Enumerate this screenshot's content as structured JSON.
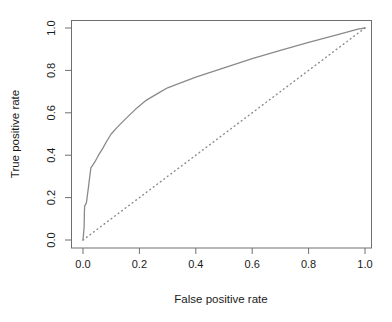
{
  "chart_data": {
    "type": "line",
    "title": "",
    "xlabel": "False positive rate",
    "ylabel": "True positive rate",
    "xlim": [
      0.0,
      1.0
    ],
    "ylim": [
      0.0,
      1.0
    ],
    "grid": false,
    "legend": "none",
    "x_ticks": [
      0.0,
      0.2,
      0.4,
      0.6,
      0.8,
      1.0
    ],
    "y_ticks": [
      0.0,
      0.2,
      0.4,
      0.6,
      0.8,
      1.0
    ],
    "x_tick_labels": [
      "0.0",
      "0.2",
      "0.4",
      "0.6",
      "0.8",
      "1.0"
    ],
    "y_tick_labels": [
      "0.0",
      "0.2",
      "0.4",
      "0.6",
      "0.8",
      "1.0"
    ],
    "series": [
      {
        "name": "ROC curve",
        "style": "solid",
        "color": "#8a8a8a",
        "points": [
          [
            0.0,
            0.0
          ],
          [
            0.004,
            0.06
          ],
          [
            0.005,
            0.135
          ],
          [
            0.006,
            0.16
          ],
          [
            0.012,
            0.175
          ],
          [
            0.016,
            0.215
          ],
          [
            0.02,
            0.255
          ],
          [
            0.024,
            0.3
          ],
          [
            0.028,
            0.34
          ],
          [
            0.034,
            0.352
          ],
          [
            0.042,
            0.368
          ],
          [
            0.055,
            0.4
          ],
          [
            0.07,
            0.432
          ],
          [
            0.085,
            0.468
          ],
          [
            0.1,
            0.5
          ],
          [
            0.12,
            0.53
          ],
          [
            0.15,
            0.57
          ],
          [
            0.185,
            0.615
          ],
          [
            0.225,
            0.66
          ],
          [
            0.27,
            0.695
          ],
          [
            0.3,
            0.718
          ],
          [
            0.33,
            0.733
          ],
          [
            0.4,
            0.768
          ],
          [
            0.5,
            0.812
          ],
          [
            0.6,
            0.855
          ],
          [
            0.7,
            0.895
          ],
          [
            0.8,
            0.932
          ],
          [
            0.9,
            0.968
          ],
          [
            0.975,
            0.995
          ],
          [
            1.0,
            1.0
          ]
        ]
      },
      {
        "name": "Chance diagonal",
        "style": "dotted",
        "color": "#8a8a8a",
        "points": [
          [
            0.0,
            0.0
          ],
          [
            1.0,
            1.0
          ]
        ]
      }
    ]
  },
  "axes": {
    "x_title": "False positive rate",
    "y_title": "True positive rate"
  },
  "header": {
    "clipped_text": ""
  },
  "colors": {
    "curve": "#8a8a8a",
    "diagonal": "#8a8a8a",
    "axis": "#6f6f6f",
    "text": "#1a1a1a",
    "background": "#ffffff"
  }
}
